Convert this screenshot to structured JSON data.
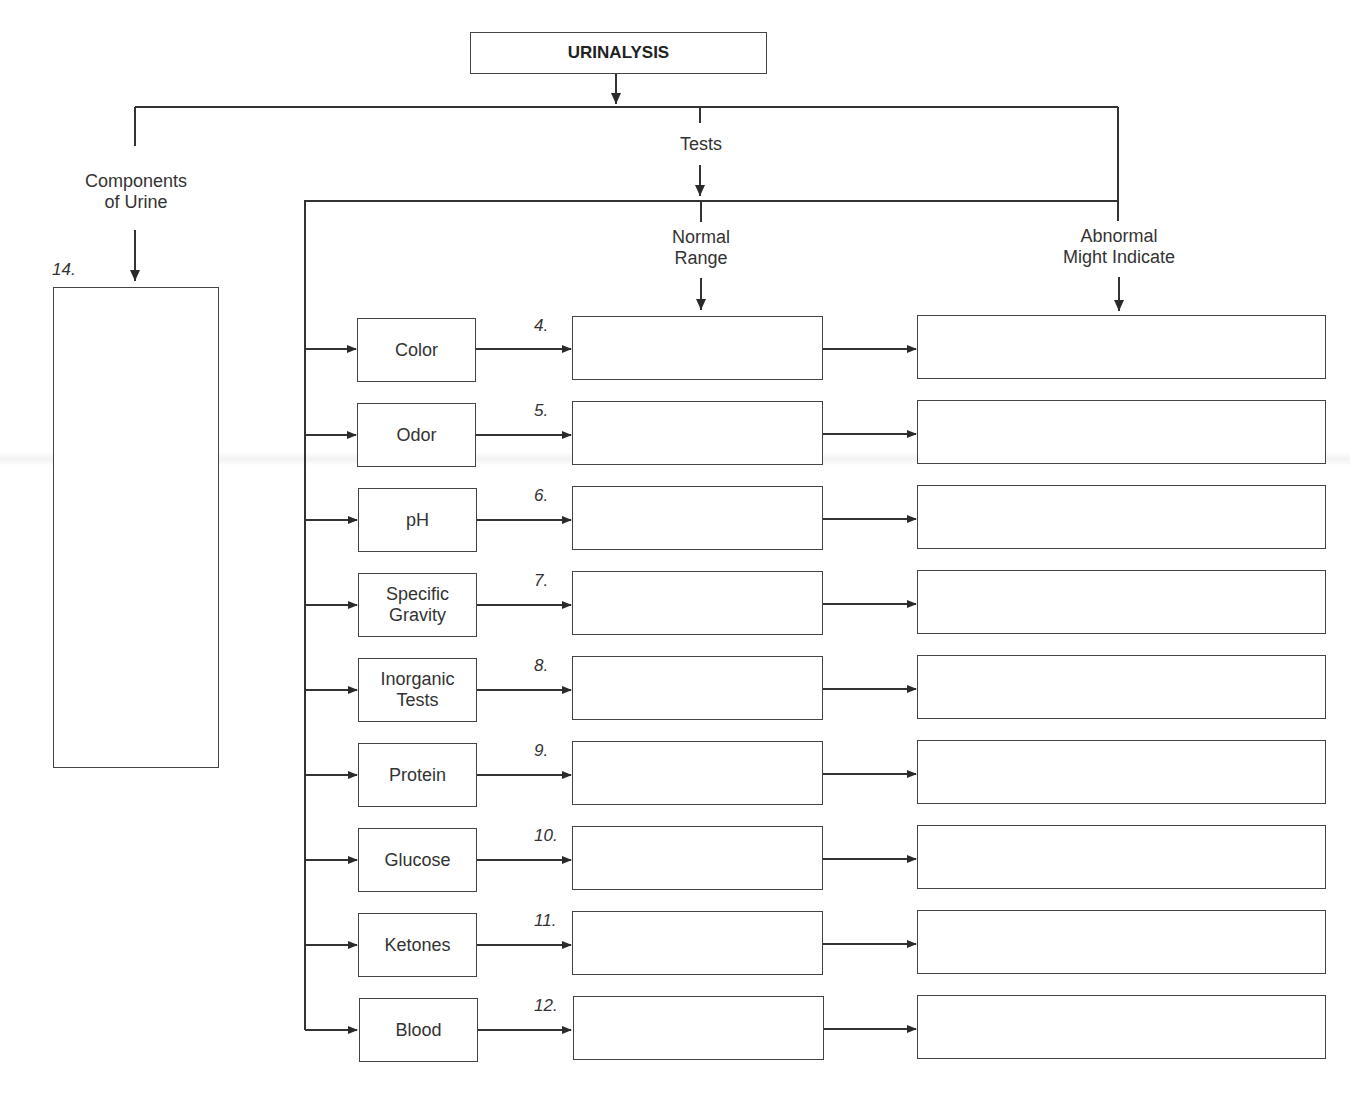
{
  "title": "URINALYSIS",
  "branches": {
    "components": {
      "label_line1": "Components",
      "label_line2": "of Urine",
      "item_number": "14."
    },
    "tests": {
      "label": "Tests"
    },
    "normal_range": {
      "label_line1": "Normal",
      "label_line2": "Range"
    },
    "abnormal": {
      "label_line1": "Abnormal",
      "label_line2": "Might Indicate"
    }
  },
  "rows": [
    {
      "test_line1": "Color",
      "test_line2": "",
      "number": "4.",
      "normal": "",
      "abnormal": ""
    },
    {
      "test_line1": "Odor",
      "test_line2": "",
      "number": "5.",
      "normal": "",
      "abnormal": ""
    },
    {
      "test_line1": "pH",
      "test_line2": "",
      "number": "6.",
      "normal": "",
      "abnormal": ""
    },
    {
      "test_line1": "Specific",
      "test_line2": "Gravity",
      "number": "7.",
      "normal": "",
      "abnormal": ""
    },
    {
      "test_line1": "Inorganic",
      "test_line2": "Tests",
      "number": "8.",
      "normal": "",
      "abnormal": ""
    },
    {
      "test_line1": "Protein",
      "test_line2": "",
      "number": "9.",
      "normal": "",
      "abnormal": ""
    },
    {
      "test_line1": "Glucose",
      "test_line2": "",
      "number": "10.",
      "normal": "",
      "abnormal": ""
    },
    {
      "test_line1": "Ketones",
      "test_line2": "",
      "number": "11.",
      "normal": "",
      "abnormal": ""
    },
    {
      "test_line1": "Blood",
      "test_line2": "",
      "number": "12.",
      "normal": "",
      "abnormal": ""
    }
  ],
  "colors": {
    "line": "#333333",
    "box_border": "#444444",
    "background": "#ffffff"
  }
}
